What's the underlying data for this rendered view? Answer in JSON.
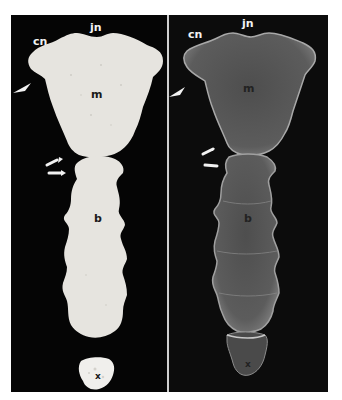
{
  "figure": {
    "panels": [
      {
        "id": "left",
        "kind": "photograph",
        "labels": {
          "cn": "cn",
          "jn": "jn",
          "m": "m",
          "b": "b",
          "x": "x"
        },
        "markers": [
          "arrowhead",
          "arrow",
          "arrow"
        ]
      },
      {
        "id": "right",
        "kind": "radiograph",
        "labels": {
          "cn": "cn",
          "jn": "jn",
          "m": "m",
          "b": "b",
          "x": "x"
        },
        "markers": [
          "arrowhead",
          "arrow",
          "arrow"
        ]
      }
    ],
    "colors": {
      "background": "#050505",
      "bone_photo": "#e6e4df",
      "bone_xray": "#5a5a5a",
      "bone_xray_edge": "#b8b8b8",
      "divider": "#cfcfcf"
    }
  }
}
